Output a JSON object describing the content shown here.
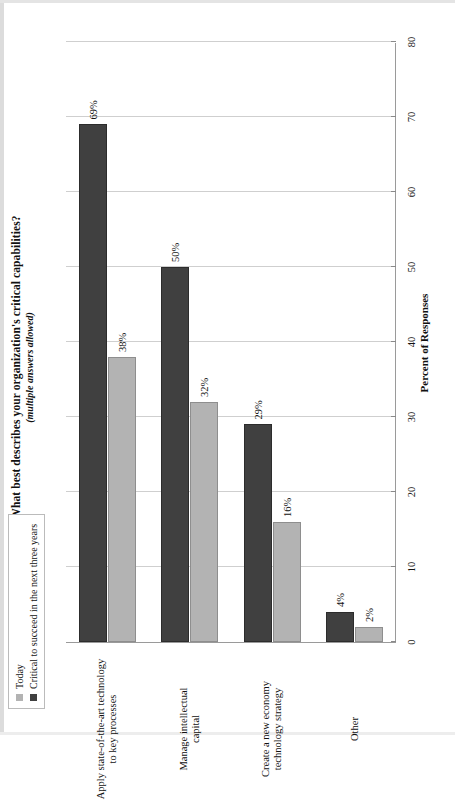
{
  "page": {
    "title": "What best describes your organization's critical capabilities?",
    "subtitle": "(multiple answers allowed)"
  },
  "legend": {
    "items": [
      {
        "label": "Today",
        "color": "#b3b3b3"
      },
      {
        "label": "Critical to succeed in the next three years",
        "color": "#404040"
      }
    ]
  },
  "axis": {
    "value_title": "Percent of Responses",
    "ticks": [
      "0",
      "10",
      "20",
      "30",
      "40",
      "50",
      "60",
      "70",
      "80"
    ]
  },
  "chart_data": {
    "type": "bar",
    "orientation": "horizontal",
    "title": "What best describes your organization's critical capabilities?",
    "subtitle": "(multiple answers allowed)",
    "xlabel": "Percent of Responses",
    "ylabel": "",
    "xlim": [
      0,
      80
    ],
    "xticks": [
      0,
      10,
      20,
      30,
      40,
      50,
      60,
      70,
      80
    ],
    "grid": true,
    "legend_position": "top-left",
    "categories": [
      "Apply state-of-the-art technology to key processes",
      "Manage intellectual capital",
      "Create a new economy technology strategy",
      "Other"
    ],
    "category_lines": [
      [
        "Apply state-of-the-art technology",
        "to key processes"
      ],
      [
        "Manage intellectual",
        "capital"
      ],
      [
        "Create a new economy",
        "technology strategy"
      ],
      [
        "Other"
      ]
    ],
    "series": [
      {
        "name": "Today",
        "color": "#b3b3b3",
        "values": [
          38,
          32,
          16,
          2
        ],
        "labels": [
          "38%",
          "32%",
          "16%",
          "2%"
        ]
      },
      {
        "name": "Critical to succeed in the next three years",
        "color": "#404040",
        "values": [
          69,
          50,
          29,
          4
        ],
        "labels": [
          "69%",
          "50%",
          "29%",
          "4%"
        ]
      }
    ]
  }
}
